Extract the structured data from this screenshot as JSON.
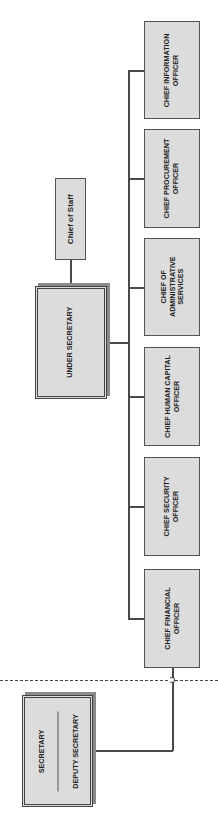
{
  "chart": {
    "title": "",
    "orientation": "rotated-90-ccw",
    "colors": {
      "box_fill": "#dcdcdc",
      "box_border": "#555555",
      "text": "#222222",
      "shadow": "#8a8a8a",
      "background": "#ffffff"
    }
  },
  "secretary": {
    "line1": "SECRETARY",
    "line2": "DEPUTY SECRETARY"
  },
  "under_secretary": {
    "label": "UNDER SECRETARY"
  },
  "chief_of_staff": {
    "label": "Chief of Staff"
  },
  "chiefs": [
    {
      "line1": "CHIEF INFORMATION",
      "line2": "OFFICER"
    },
    {
      "line1": "CHIEF PROCUREMENT",
      "line2": "OFFICER"
    },
    {
      "line1": "CHIEF OF",
      "line2": "ADMINISTRATIVE",
      "line3": "SERVICES"
    },
    {
      "line1": "CHIEF HUMAN CAPITAL",
      "line2": "OFFICER"
    },
    {
      "line1": "CHIEF SECURITY",
      "line2": "OFFICER"
    },
    {
      "line1": "CHIEF FINANCIAL",
      "line2": "OFFICER"
    }
  ]
}
